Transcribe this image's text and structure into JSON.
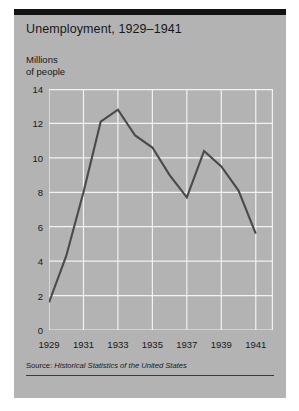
{
  "figure": {
    "title": "Unemployment, 1929–1941",
    "y_axis_label": "Millions\nof people",
    "source_lead": "Source: ",
    "source_title": "Historical Statistics of the United States",
    "colors": {
      "panel": "#b3b3b3",
      "rule": "#121212",
      "gridline": "#f2f2f2",
      "line": "#4a4a4a",
      "text": "#16191c"
    }
  },
  "chart_data": {
    "type": "line",
    "title": "Unemployment, 1929–1941",
    "xlabel": "",
    "ylabel": "Millions of people",
    "x": [
      1929,
      1930,
      1931,
      1932,
      1933,
      1934,
      1935,
      1936,
      1937,
      1938,
      1939,
      1940,
      1941
    ],
    "values": [
      1.6,
      4.3,
      8.0,
      12.1,
      12.8,
      11.3,
      10.6,
      9.0,
      7.7,
      10.4,
      9.5,
      8.1,
      5.6
    ],
    "xlim": [
      1929,
      1942
    ],
    "ylim": [
      0,
      14
    ],
    "xticks": [
      1929,
      1931,
      1933,
      1935,
      1937,
      1939,
      1941
    ],
    "xtick_labels": [
      "1929",
      "1931",
      "1933",
      "1935",
      "1937",
      "1939",
      "1941"
    ],
    "yticks": [
      0,
      2,
      4,
      6,
      8,
      10,
      12,
      14
    ],
    "ytick_labels": [
      "0",
      "2",
      "4",
      "6",
      "8",
      "10",
      "12",
      "14"
    ],
    "grid": true,
    "legend": false,
    "series_name": "Unemployment (millions of people)"
  }
}
